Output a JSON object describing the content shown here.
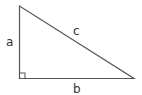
{
  "diagram": {
    "type": "right-triangle",
    "labels": {
      "a": "a",
      "b": "b",
      "c": "c"
    },
    "colors": {
      "stroke": "#555555",
      "text": "#333333",
      "background": "#ffffff"
    },
    "right_angle_marker": true
  }
}
